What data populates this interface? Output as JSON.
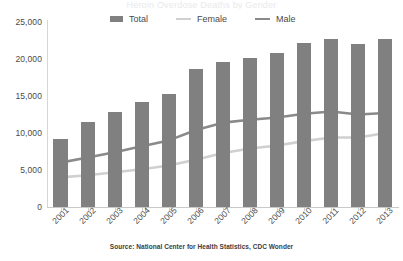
{
  "clipped_title": "Heroin Overdose Deaths by Gender",
  "source_note": "Source: National Center for Health Statistics, CDC Wonder",
  "legend": {
    "position": "top-center",
    "items": [
      {
        "label": "Total",
        "type": "bar",
        "color": "#808080"
      },
      {
        "label": "Female",
        "type": "line",
        "color": "#d0d0d0"
      },
      {
        "label": "Male",
        "type": "line",
        "color": "#8a8a8a"
      }
    ]
  },
  "chart_data": {
    "type": "bar",
    "title": "Heroin Overdose Deaths by Gender",
    "subtitle": "",
    "xlabel": "",
    "ylabel": "",
    "categories": [
      "2001",
      "2002",
      "2003",
      "2004",
      "2005",
      "2006",
      "2007",
      "2008",
      "2009",
      "2010",
      "2011",
      "2012",
      "2013"
    ],
    "ylim": [
      0,
      25000
    ],
    "yticks": [
      0,
      5000,
      10000,
      15000,
      20000,
      25000
    ],
    "ytick_labels": [
      "0",
      "5,000",
      "10,000",
      "15,000",
      "20,000",
      "25,000"
    ],
    "grid": false,
    "series": [
      {
        "name": "Total",
        "type": "bar",
        "color": "#808080",
        "values": [
          9200,
          11500,
          12800,
          14200,
          15300,
          18600,
          19600,
          20200,
          20800,
          22200,
          22700,
          22000,
          22700
        ]
      },
      {
        "name": "Female",
        "type": "line",
        "color": "#d0d0d0",
        "values": [
          4000,
          4300,
          4700,
          5100,
          5600,
          6400,
          7300,
          7900,
          8300,
          8900,
          9400,
          9400,
          10000
        ]
      },
      {
        "name": "Male",
        "type": "line",
        "color": "#8a8a8a",
        "values": [
          6000,
          6700,
          7400,
          8200,
          9000,
          10400,
          11400,
          11800,
          12100,
          12600,
          12900,
          12500,
          12700
        ]
      }
    ]
  }
}
